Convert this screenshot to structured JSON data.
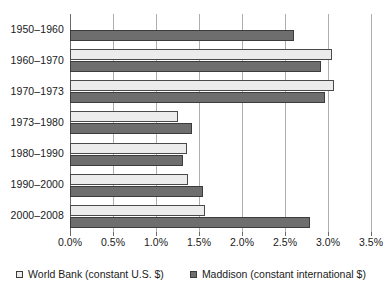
{
  "chart_data": {
    "type": "bar",
    "orientation": "horizontal",
    "title": "",
    "xlabel": "",
    "ylabel": "",
    "categories": [
      "1950–1960",
      "1960–1970",
      "1970–1973",
      "1973–1980",
      "1980–1990",
      "1990–2000",
      "2000–2008"
    ],
    "series": [
      {
        "name": "World Bank (constant U.S. $)",
        "color": "#ececec",
        "values": [
          null,
          3.05,
          3.07,
          1.26,
          1.36,
          1.37,
          1.57
        ]
      },
      {
        "name": "Maddison (constant international $)",
        "color": "#6e6e6e",
        "values": [
          2.6,
          2.92,
          2.96,
          1.42,
          1.31,
          1.55,
          2.79
        ]
      }
    ],
    "xlim": [
      0.0,
      3.5
    ],
    "x_ticks": [
      0.0,
      0.5,
      1.0,
      1.5,
      2.0,
      2.5,
      3.0,
      3.5
    ],
    "x_tick_labels": [
      "0.0%",
      "0.5%",
      "1.0%",
      "1.5%",
      "2.0%",
      "2.5%",
      "3.0%",
      "3.5%"
    ],
    "grid": true,
    "grid_axis": "x",
    "legend_position": "bottom"
  },
  "legend": {
    "items": [
      {
        "label": "World Bank (constant U.S. $)",
        "swatch": "worldbank"
      },
      {
        "label": "Maddison (constant international $)",
        "swatch": "maddison"
      }
    ]
  }
}
